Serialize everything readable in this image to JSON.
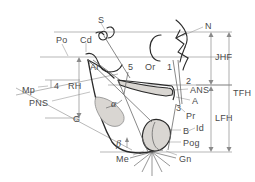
{
  "diagram": {
    "type": "lateral-cephalometric-analysis",
    "colors": {
      "outline": "#2b2b2b",
      "reference_line": "#8a8a8a",
      "measure_line": "#8a8a8a",
      "label_text": "#4a4a4a",
      "shaded_fill": "#d9d6d2",
      "background": "#ffffff"
    },
    "landmarks": [
      {
        "id": "S",
        "label": "S",
        "x": 98,
        "y": 16,
        "kind": "skeletal"
      },
      {
        "id": "N",
        "label": "N",
        "x": 205,
        "y": 22,
        "kind": "skeletal"
      },
      {
        "id": "Po",
        "label": "Po",
        "x": 56,
        "y": 36,
        "kind": "skeletal"
      },
      {
        "id": "Cd",
        "label": "Cd",
        "x": 80,
        "y": 36,
        "kind": "skeletal"
      },
      {
        "id": "Ar",
        "label": "Ar",
        "x": 90,
        "y": 63,
        "kind": "skeletal"
      },
      {
        "id": "5",
        "label": "5",
        "x": 128,
        "y": 63,
        "kind": "dental"
      },
      {
        "id": "Or",
        "label": "Or",
        "x": 145,
        "y": 63,
        "kind": "skeletal"
      },
      {
        "id": "1",
        "label": "1",
        "x": 167,
        "y": 63,
        "kind": "dental"
      },
      {
        "id": "2",
        "label": "2",
        "x": 186,
        "y": 77,
        "kind": "dental"
      },
      {
        "id": "ANS",
        "label": "ANS",
        "x": 190,
        "y": 88,
        "kind": "skeletal"
      },
      {
        "id": "A",
        "label": "A",
        "x": 192,
        "y": 99,
        "kind": "skeletal"
      },
      {
        "id": "3",
        "label": "3",
        "x": 176,
        "y": 106,
        "kind": "dental"
      },
      {
        "id": "Pr",
        "label": "Pr",
        "x": 186,
        "y": 114,
        "kind": "skeletal"
      },
      {
        "id": "B",
        "label": "B",
        "x": 182,
        "y": 129,
        "kind": "skeletal"
      },
      {
        "id": "Id",
        "label": "Id",
        "x": 196,
        "y": 126,
        "kind": "skeletal"
      },
      {
        "id": "Pog",
        "label": "Pog",
        "x": 182,
        "y": 141,
        "kind": "skeletal"
      },
      {
        "id": "Gn",
        "label": "Gn",
        "x": 179,
        "y": 157,
        "kind": "skeletal"
      },
      {
        "id": "Me",
        "label": "Me",
        "x": 119,
        "y": 157,
        "kind": "skeletal"
      },
      {
        "id": "Mp",
        "label": "Mp",
        "x": 24,
        "y": 86,
        "kind": "plane"
      },
      {
        "id": "4",
        "label": "4",
        "x": 55,
        "y": 83,
        "kind": "dental"
      },
      {
        "id": "RH",
        "label": "RH",
        "x": 69,
        "y": 83,
        "kind": "measure"
      },
      {
        "id": "PNS",
        "label": "PNS",
        "x": 31,
        "y": 100,
        "kind": "skeletal"
      },
      {
        "id": "G",
        "label": "G",
        "x": 73,
        "y": 115,
        "kind": "region"
      }
    ],
    "angles": [
      {
        "id": "alpha",
        "label": "α",
        "x": 112,
        "y": 101
      },
      {
        "id": "beta",
        "label": "β",
        "x": 117,
        "y": 141
      }
    ],
    "measurements": [
      {
        "id": "JHF",
        "label": "JHF",
        "x": 215,
        "y": 57,
        "description": "jaw height fraction"
      },
      {
        "id": "TFH",
        "label": "TFH",
        "x": 233,
        "y": 93,
        "description": "total facial height"
      },
      {
        "id": "LFH",
        "label": "LFH",
        "x": 215,
        "y": 118,
        "description": "lower facial height"
      }
    ]
  }
}
